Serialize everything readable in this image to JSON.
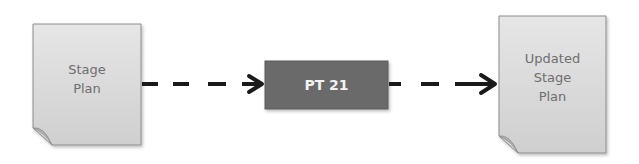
{
  "diagram": {
    "nodes": [
      {
        "id": "stage-plan",
        "shape": "document",
        "label": "Stage\nPlan"
      },
      {
        "id": "pt21",
        "shape": "process-box",
        "label": "PT 21"
      },
      {
        "id": "updated-stage-plan",
        "shape": "document",
        "label": "Updated\nStage\nPlan"
      }
    ],
    "edges": [
      {
        "from": "stage-plan",
        "to": "pt21",
        "style": "dashed-arrow"
      },
      {
        "from": "pt21",
        "to": "updated-stage-plan",
        "style": "dashed-arrow"
      }
    ],
    "colors": {
      "document_fill": "#d9d9d9",
      "document_border": "#8c8c8c",
      "box_fill": "#6b6b6b",
      "box_text": "#f2f2f2",
      "arrow": "#1a1a1a"
    }
  }
}
